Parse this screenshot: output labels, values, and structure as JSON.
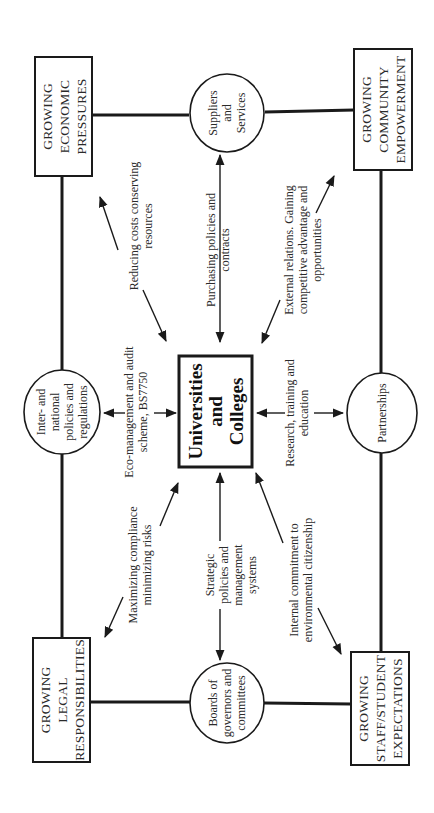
{
  "diagram": {
    "orientation": "rotated -90deg (text reads bottom-to-top)",
    "center": {
      "lines": [
        "Universities",
        "and",
        "Colleges"
      ]
    },
    "corner_boxes": {
      "economic": {
        "lines": [
          "GROWING",
          "ECONOMIC",
          "PRESSURES"
        ]
      },
      "community": {
        "lines": [
          "GROWING",
          "COMMUNITY",
          "EMPOWERMENT"
        ]
      },
      "legal": {
        "lines": [
          "GROWING",
          "LEGAL",
          "RESPONSIBILITIES"
        ]
      },
      "staff": {
        "lines": [
          "GROWING",
          "STAFF/STUDENT",
          "EXPECTATIONS"
        ]
      }
    },
    "circles": {
      "suppliers": {
        "lines": [
          "Suppliers",
          "and",
          "Services"
        ]
      },
      "international": {
        "lines": [
          "Inter- and",
          "national",
          "policies and",
          "regulations"
        ]
      },
      "partnerships": {
        "lines": [
          "Partnerships"
        ]
      },
      "boards": {
        "lines": [
          "Boards of",
          "governors and",
          "committees"
        ]
      }
    },
    "arrow_labels": {
      "reducing_costs": {
        "lines": [
          "Reducing costs conserving",
          "resources"
        ]
      },
      "purchasing": {
        "lines": [
          "Purchasing policies and",
          "contracts"
        ]
      },
      "external_relations": {
        "lines": [
          "External relations. Gaining",
          "competitive advantage and",
          "opportunities"
        ]
      },
      "eco_management": {
        "lines": [
          "Eco-management and audit",
          "scheme, BS7750"
        ]
      },
      "research": {
        "lines": [
          "Research, training and",
          "education"
        ]
      },
      "compliance": {
        "lines": [
          "Maximizing compliance",
          "minimizing risks"
        ]
      },
      "strategic": {
        "lines": [
          "Strategic",
          "policies and",
          "management",
          "systems"
        ]
      },
      "internal_commitment": {
        "lines": [
          "Internal commitment to",
          "environmental citizenship"
        ]
      }
    },
    "colors": {
      "line": "#1a1a1a",
      "background": "#ffffff",
      "text": "#2a2a2a"
    }
  }
}
